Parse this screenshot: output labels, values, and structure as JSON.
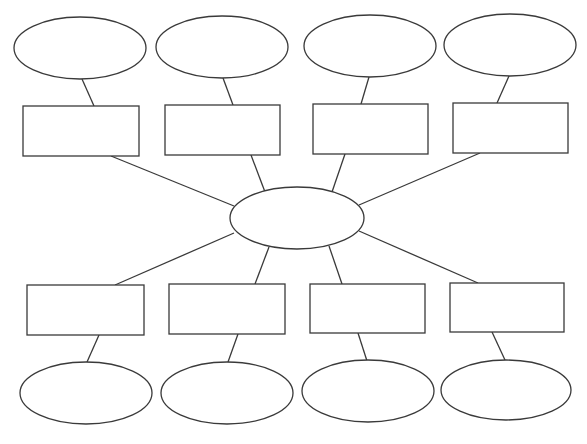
{
  "diagram": {
    "type": "concept-map-worksheet",
    "stroke_color": "#3a3a3a",
    "background": "#ffffff",
    "center": {
      "id": "center",
      "shape": "ellipse",
      "label": "",
      "cx": 297,
      "cy": 218,
      "rx": 67,
      "ry": 31
    },
    "top_ellipses": [
      {
        "id": "te1",
        "label": "",
        "cx": 80,
        "cy": 48,
        "rx": 66,
        "ry": 31
      },
      {
        "id": "te2",
        "label": "",
        "cx": 222,
        "cy": 47,
        "rx": 66,
        "ry": 31
      },
      {
        "id": "te3",
        "label": "",
        "cx": 370,
        "cy": 46,
        "rx": 66,
        "ry": 31
      },
      {
        "id": "te4",
        "label": "",
        "cx": 510,
        "cy": 45,
        "rx": 66,
        "ry": 31
      }
    ],
    "top_boxes": [
      {
        "id": "tb1",
        "label": "",
        "x": 23,
        "y": 106,
        "w": 116,
        "h": 50
      },
      {
        "id": "tb2",
        "label": "",
        "x": 165,
        "y": 105,
        "w": 115,
        "h": 50
      },
      {
        "id": "tb3",
        "label": "",
        "x": 313,
        "y": 104,
        "w": 115,
        "h": 50
      },
      {
        "id": "tb4",
        "label": "",
        "x": 453,
        "y": 103,
        "w": 115,
        "h": 50
      }
    ],
    "bottom_boxes": [
      {
        "id": "bb1",
        "label": "",
        "x": 27,
        "y": 285,
        "w": 117,
        "h": 50
      },
      {
        "id": "bb2",
        "label": "",
        "x": 169,
        "y": 284,
        "w": 116,
        "h": 50
      },
      {
        "id": "bb3",
        "label": "",
        "x": 310,
        "y": 284,
        "w": 115,
        "h": 49
      },
      {
        "id": "bb4",
        "label": "",
        "x": 450,
        "y": 283,
        "w": 114,
        "h": 49
      }
    ],
    "bottom_ellipses": [
      {
        "id": "be1",
        "label": "",
        "cx": 86,
        "cy": 393,
        "rx": 66,
        "ry": 31
      },
      {
        "id": "be2",
        "label": "",
        "cx": 227,
        "cy": 393,
        "rx": 66,
        "ry": 31
      },
      {
        "id": "be3",
        "label": "",
        "cx": 368,
        "cy": 391,
        "rx": 66,
        "ry": 31
      },
      {
        "id": "be4",
        "label": "",
        "cx": 506,
        "cy": 390,
        "rx": 65,
        "ry": 30
      }
    ],
    "edges": [
      {
        "from": "te1",
        "to": "tb1",
        "x1": 82,
        "y1": 79,
        "x2": 94,
        "y2": 106
      },
      {
        "from": "te2",
        "to": "tb2",
        "x1": 223,
        "y1": 78,
        "x2": 233,
        "y2": 105
      },
      {
        "from": "te3",
        "to": "tb3",
        "x1": 369,
        "y1": 77,
        "x2": 361,
        "y2": 104
      },
      {
        "from": "te4",
        "to": "tb4",
        "x1": 509,
        "y1": 76,
        "x2": 497,
        "y2": 103
      },
      {
        "from": "tb1",
        "to": "center",
        "x1": 111,
        "y1": 156,
        "x2": 234,
        "y2": 206
      },
      {
        "from": "tb2",
        "to": "center",
        "x1": 251,
        "y1": 155,
        "x2": 265,
        "y2": 192
      },
      {
        "from": "tb3",
        "to": "center",
        "x1": 345,
        "y1": 154,
        "x2": 332,
        "y2": 192
      },
      {
        "from": "tb4",
        "to": "center",
        "x1": 480,
        "y1": 153,
        "x2": 359,
        "y2": 205
      },
      {
        "from": "center",
        "to": "bb1",
        "x1": 234,
        "y1": 233,
        "x2": 115,
        "y2": 285
      },
      {
        "from": "center",
        "to": "bb2",
        "x1": 269,
        "y1": 247,
        "x2": 255,
        "y2": 284
      },
      {
        "from": "center",
        "to": "bb3",
        "x1": 329,
        "y1": 246,
        "x2": 342,
        "y2": 284
      },
      {
        "from": "center",
        "to": "bb4",
        "x1": 359,
        "y1": 231,
        "x2": 478,
        "y2": 283
      },
      {
        "from": "bb1",
        "to": "be1",
        "x1": 99,
        "y1": 335,
        "x2": 87,
        "y2": 362
      },
      {
        "from": "bb2",
        "to": "be2",
        "x1": 238,
        "y1": 334,
        "x2": 228,
        "y2": 362
      },
      {
        "from": "bb3",
        "to": "be3",
        "x1": 358,
        "y1": 333,
        "x2": 367,
        "y2": 361
      },
      {
        "from": "bb4",
        "to": "be4",
        "x1": 492,
        "y1": 332,
        "x2": 505,
        "y2": 360
      }
    ]
  }
}
